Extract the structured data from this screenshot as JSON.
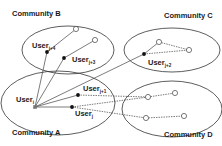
{
  "diagram": {
    "communities": [
      {
        "id": "A",
        "label": "Community A",
        "cx": 58,
        "cy": 103,
        "rx": 57,
        "ry": 32,
        "label_x": 12,
        "label_y": 135
      },
      {
        "id": "B",
        "label": "Community B",
        "cx": 68,
        "cy": 50,
        "rx": 46,
        "ry": 24,
        "label_x": 12,
        "label_y": 16
      },
      {
        "id": "C",
        "label": "Community C",
        "cx": 172,
        "cy": 50,
        "rx": 48,
        "ry": 22,
        "label_x": 164,
        "label_y": 18
      },
      {
        "id": "D",
        "label": "Community D",
        "cx": 172,
        "cy": 109,
        "rx": 50,
        "ry": 28,
        "label_x": 164,
        "label_y": 137
      }
    ],
    "users": [
      {
        "name": "User",
        "sub": "i",
        "x": 35,
        "y": 107,
        "style": "gray-square",
        "label_x": 16,
        "label_y": 102
      },
      {
        "name": "User",
        "sub": "j+4",
        "x": 47,
        "y": 52,
        "style": "filled",
        "label_x": 32,
        "label_y": 48
      },
      {
        "name": "User",
        "sub": "j+3",
        "x": 64,
        "y": 58,
        "style": "filled",
        "label_x": 72,
        "label_y": 62
      },
      {
        "name": "User",
        "sub": "j+2",
        "x": 144,
        "y": 54,
        "style": "filled",
        "label_x": 148,
        "label_y": 65
      },
      {
        "name": "User",
        "sub": "j+1",
        "x": 78,
        "y": 95,
        "style": "filled",
        "label_x": 83,
        "label_y": 91
      },
      {
        "name": "User",
        "sub": "j",
        "x": 72,
        "y": 107,
        "style": "filled",
        "label_x": 75,
        "label_y": 116
      }
    ],
    "open_nodes": [
      {
        "x": 76,
        "y": 29,
        "community": "B"
      },
      {
        "x": 95,
        "y": 40,
        "community": "B"
      },
      {
        "x": 159,
        "y": 42,
        "community": "C"
      },
      {
        "x": 189,
        "y": 50,
        "community": "C"
      },
      {
        "x": 148,
        "y": 97,
        "community": "D"
      },
      {
        "x": 175,
        "y": 93,
        "community": "D"
      },
      {
        "x": 146,
        "y": 118,
        "community": "D"
      },
      {
        "x": 184,
        "y": 116,
        "community": "D"
      }
    ],
    "solid_edges": [
      {
        "from": "User_i",
        "to": "User_j+4"
      },
      {
        "from": "User_i",
        "to": "User_j+3"
      },
      {
        "from": "User_i",
        "to": "User_j+2"
      },
      {
        "from": "User_i",
        "to": "User_j+1"
      },
      {
        "from": "User_i",
        "to": "User_j"
      },
      {
        "from": "User_j+4",
        "to": "B_open_1"
      },
      {
        "from": "User_j+3",
        "to": "B_open_2"
      },
      {
        "from": "User_j+2",
        "to": "C_open_1"
      }
    ],
    "dashed_edges": [
      {
        "from": "User_j+2",
        "to": "C_open_2"
      },
      {
        "from": "C_open_1",
        "to": "C_open_2"
      },
      {
        "from": "User_j+1",
        "to": "D_open_1"
      },
      {
        "from": "D_open_1",
        "to": "D_open_2"
      },
      {
        "from": "User_j",
        "to": "D_open_1"
      },
      {
        "from": "User_j",
        "to": "D_open_3"
      },
      {
        "from": "D_open_3",
        "to": "D_open_4"
      }
    ],
    "colors": {
      "ellipse_stroke": "#333333",
      "edge": "#444444",
      "filled_node": "#111111",
      "gray_node": "#777777",
      "open_node_fill": "#ffffff"
    }
  }
}
